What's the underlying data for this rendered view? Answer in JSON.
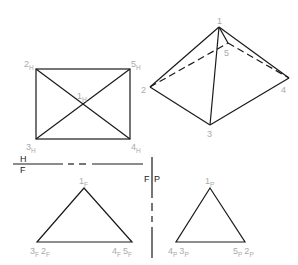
{
  "colors": {
    "line": "#1a1a1a",
    "label": "#aaaaaa",
    "plane_label": "#222222"
  },
  "pictorial": {
    "vertices": {
      "1": "1",
      "2": "2",
      "3": "3",
      "4": "4",
      "5": "5"
    }
  },
  "top_view": {
    "labels": {
      "v1": "1",
      "v2": "2",
      "v3": "3",
      "v4": "4",
      "v5": "5",
      "sub": "H"
    }
  },
  "fold_lines": {
    "hf": {
      "top": "H",
      "bottom": "F"
    },
    "fp": {
      "left": "F",
      "right": "P"
    }
  },
  "front_view": {
    "labels": {
      "v1": "1",
      "v3": "3",
      "v2": "2",
      "v4": "4",
      "v5": "5",
      "sub": "F"
    }
  },
  "profile_view": {
    "labels": {
      "v1": "1",
      "v4": "4",
      "v3": "3",
      "v5": "5",
      "v2": "2",
      "sub": "P"
    }
  }
}
